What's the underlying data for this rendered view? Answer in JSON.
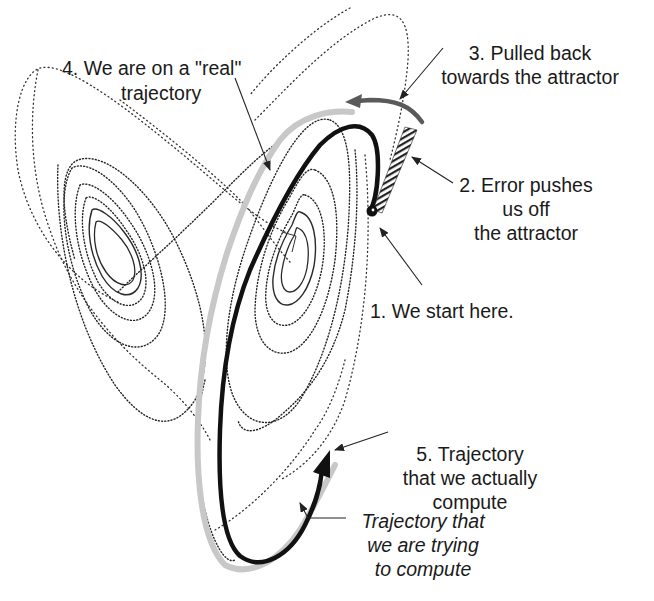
{
  "figure": {
    "colors": {
      "background": "#ffffff",
      "attractor_dots": "#333333",
      "computed_trajectory": "#111111",
      "true_trajectory": "#c8c8c8",
      "pull_back_arrow": "#5a5a5a",
      "error_hatch": "#222222",
      "text": "#1a1a1a"
    },
    "annotations": [
      {
        "id": "step1",
        "lines": [
          "1.  We start here."
        ],
        "italic": false
      },
      {
        "id": "step2",
        "lines": [
          "2. Error pushes",
          "us off",
          "the attractor"
        ],
        "italic": false
      },
      {
        "id": "step3",
        "lines": [
          "3. Pulled back",
          "towards the attractor"
        ],
        "italic": false
      },
      {
        "id": "step4",
        "lines": [
          "4. We are  on a \"real\"",
          "trajectory"
        ],
        "italic": false
      },
      {
        "id": "step5",
        "lines": [
          "5. Trajectory",
          "that we actually",
          "compute"
        ],
        "italic": false
      },
      {
        "id": "target",
        "lines": [
          "Trajectory that",
          "we are trying",
          "to compute"
        ],
        "italic": true
      }
    ],
    "legend_semantics": {
      "black_thick_line": "Trajectory that we actually compute",
      "gray_thick_line": "Trajectory that we are trying to compute",
      "hatched_segment": "Error pushes us off the attractor",
      "dark_gray_arrow": "Pulled back towards the attractor",
      "black_dot": "Starting point",
      "dotted_curves": "Lorenz attractor (butterfly) orbit"
    }
  }
}
